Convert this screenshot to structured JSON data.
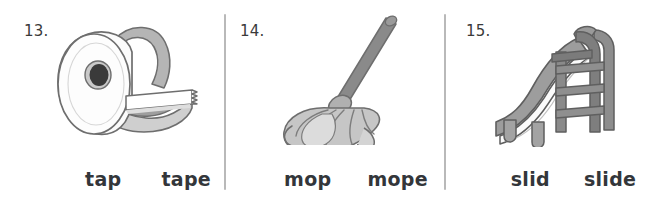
{
  "worksheet": {
    "divider_color": "#b9b9b9",
    "text_color": "#33363a",
    "items": [
      {
        "number": "13.",
        "picture": "tape-dispenser",
        "choices": [
          "tap",
          "tape"
        ]
      },
      {
        "number": "14.",
        "picture": "mop",
        "choices": [
          "mop",
          "mope"
        ]
      },
      {
        "number": "15.",
        "picture": "playground-slide",
        "choices": [
          "slid",
          "slide"
        ]
      }
    ]
  }
}
